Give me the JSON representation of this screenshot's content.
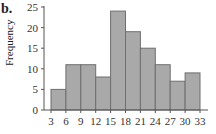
{
  "panel_label": "b.",
  "chart_data": {
    "type": "bar",
    "histogram": true,
    "title": "",
    "xlabel": "",
    "ylabel": "Frequency",
    "bin_edges": [
      3,
      6,
      9,
      12,
      15,
      18,
      21,
      24,
      27,
      30,
      33
    ],
    "categories": [
      "3-6",
      "6-9",
      "9-12",
      "12-15",
      "15-18",
      "18-21",
      "21-24",
      "24-27",
      "27-30",
      "30-33"
    ],
    "values": [
      5,
      11,
      11,
      8,
      24,
      19,
      15,
      11,
      7,
      9
    ],
    "ylim": [
      0,
      25
    ],
    "yticks": [
      0,
      5,
      10,
      15,
      20,
      25
    ],
    "xticks": [
      3,
      6,
      9,
      12,
      15,
      18,
      21,
      24,
      27,
      30,
      33
    ],
    "grid": false,
    "bar_color": "#a9a9a9",
    "bar_edge_color": "#6f6f6f"
  }
}
